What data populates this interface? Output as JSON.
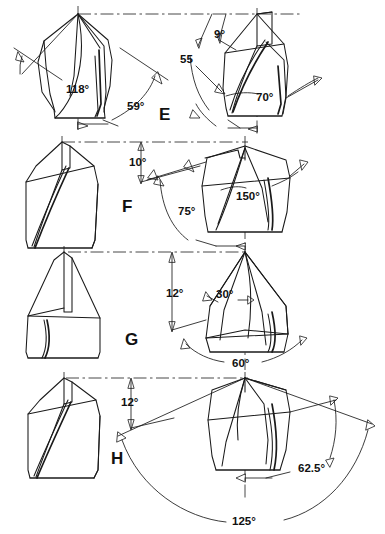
{
  "figure": {
    "background_color": "#ffffff",
    "line_color": "#1a1a1a"
  },
  "rows": [
    {
      "id": "E",
      "letter": "E",
      "side_view": {
        "name": "drill-side-view-e",
        "annotations": [
          {
            "name": "point-angle",
            "text": "118°"
          },
          {
            "name": "lip-clearance-angle",
            "text": "59°"
          }
        ]
      },
      "end_view": {
        "name": "drill-end-view-e",
        "annotations": [
          {
            "name": "web-angle",
            "text": "9°"
          },
          {
            "name": "helix-angle",
            "text": "55"
          },
          {
            "name": "chisel-edge-angle",
            "text": "70°"
          }
        ]
      }
    },
    {
      "id": "F",
      "letter": "F",
      "side_view": {
        "name": "drill-side-view-f",
        "annotations": []
      },
      "end_view": {
        "name": "drill-end-view-f",
        "annotations": [
          {
            "name": "rake-angle",
            "text": "10°"
          },
          {
            "name": "point-angle",
            "text": "150°"
          },
          {
            "name": "relief-angle",
            "text": "75°"
          }
        ]
      }
    },
    {
      "id": "G",
      "letter": "G",
      "side_view": {
        "name": "drill-side-view-g",
        "annotations": []
      },
      "end_view": {
        "name": "drill-end-view-g",
        "annotations": [
          {
            "name": "rake-angle",
            "text": "12°"
          },
          {
            "name": "chisel-edge-angle",
            "text": "30°"
          },
          {
            "name": "point-angle",
            "text": "60°"
          }
        ]
      }
    },
    {
      "id": "H",
      "letter": "H",
      "side_view": {
        "name": "drill-side-view-h",
        "annotations": []
      },
      "end_view": {
        "name": "drill-end-view-h",
        "annotations": [
          {
            "name": "rake-angle",
            "text": "12°"
          },
          {
            "name": "half-point-angle",
            "text": "62.5°"
          },
          {
            "name": "included-point-angle",
            "text": "125°"
          }
        ]
      }
    }
  ]
}
